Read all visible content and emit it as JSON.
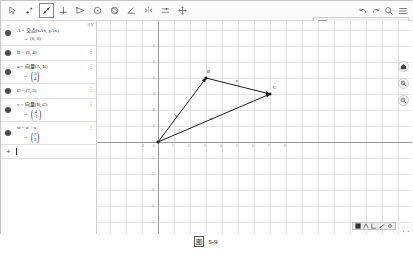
{
  "app": {
    "name": "GeoGebra Classic",
    "caption": "图 5-9"
  },
  "toolbar": {
    "tools": [
      {
        "name": "move-tool",
        "label": "Move",
        "icon": "arrow-cursor-icon",
        "selected": false
      },
      {
        "name": "point-tool",
        "label": "Point",
        "icon": "point-icon",
        "selected": false
      },
      {
        "name": "line-tool",
        "label": "Line",
        "icon": "line-through-two-points-icon",
        "selected": true
      },
      {
        "name": "perpendicular-line-tool",
        "label": "Perpendicular Line",
        "icon": "perpendicular-icon",
        "selected": false
      },
      {
        "name": "polygon-tool",
        "label": "Polygon",
        "icon": "polygon-icon",
        "selected": false
      },
      {
        "name": "circle-tool",
        "label": "Circle with Center through Point",
        "icon": "circle-icon",
        "selected": false
      },
      {
        "name": "ellipse-tool",
        "label": "Ellipse",
        "icon": "ellipse-icon",
        "selected": false
      },
      {
        "name": "angle-tool",
        "label": "Angle",
        "icon": "angle-icon",
        "selected": false
      },
      {
        "name": "reflect-tool",
        "label": "Reflect about Line",
        "icon": "reflect-icon",
        "selected": false
      },
      {
        "name": "slider-tool",
        "label": "Slider",
        "icon": "slider-icon",
        "selected": false
      },
      {
        "name": "move-graphics-tool",
        "label": "Move Graphics View",
        "icon": "move-graphics-icon",
        "selected": false
      }
    ],
    "right_tools": [
      {
        "name": "undo-button",
        "label": "Undo",
        "icon": "undo-icon"
      },
      {
        "name": "redo-button",
        "label": "Redo",
        "icon": "redo-icon"
      },
      {
        "name": "search-button",
        "label": "Search",
        "icon": "search-icon"
      },
      {
        "name": "menu-button",
        "label": "Main Menu",
        "icon": "hamburger-menu-icon"
      }
    ]
  },
  "stylebar": {
    "color_swatch": "#222222",
    "items": [
      {
        "name": "color-button",
        "label": "Color",
        "icon": "color-swatch-icon"
      },
      {
        "name": "line-style-button",
        "label": "Line Style",
        "icon": "line-style-icon"
      },
      {
        "name": "point-style-button",
        "label": "Point Style",
        "icon": "point-style-icon"
      },
      {
        "name": "label-button",
        "label": "Label",
        "icon": "label-icon"
      },
      {
        "name": "settings-button",
        "label": "Settings",
        "icon": "gear-icon"
      },
      {
        "name": "more-button",
        "label": "More",
        "icon": "kebab-menu-icon"
      },
      {
        "name": "close-stylebar-button",
        "label": "Close",
        "icon": "collapse-arrow-icon"
      }
    ]
  },
  "algebra": {
    "header_label": "≡V",
    "rows": [
      {
        "name": "algebra-row-point-a",
        "expression": "A = 交点(xAx, yAx)",
        "output_arrow": "→",
        "output": "(0, 0)",
        "output_kind": "point",
        "visible": true,
        "has_kebab": false
      },
      {
        "name": "algebra-row-point-b",
        "expression": "B = (3, 4)",
        "output_arrow": "",
        "output": "",
        "output_kind": "none",
        "visible": true,
        "has_kebab": true
      },
      {
        "name": "algebra-row-vector-u",
        "expression": "u = 向量(A, B)",
        "output_arrow": "→",
        "output_kind": "column",
        "output_top": "3",
        "output_bottom": "4",
        "visible": true,
        "has_kebab": true
      },
      {
        "name": "algebra-row-point-c",
        "expression": "C = (7, 3)",
        "output_arrow": "",
        "output": "",
        "output_kind": "none",
        "visible": true,
        "has_kebab": true
      },
      {
        "name": "algebra-row-vector-v",
        "expression": "v = 向量(B, C)",
        "output_arrow": "→",
        "output_kind": "column",
        "output_top": "4",
        "output_bottom": "-1",
        "visible": true,
        "has_kebab": true
      },
      {
        "name": "algebra-row-vector-w",
        "expression": "w = u + v",
        "output_arrow": "→",
        "output_kind": "column",
        "output_top": "7",
        "output_bottom": "3",
        "visible": true,
        "has_kebab": true
      }
    ],
    "input_row": {
      "name": "algebra-input-row",
      "plus": "+",
      "value": "",
      "placeholder": ""
    }
  },
  "graph": {
    "xlabel": "x",
    "ylabel": "y",
    "origin_label": "0",
    "x_ticks": [
      "1",
      "2",
      "3",
      "4",
      "5",
      "6",
      "7",
      "8"
    ],
    "x_tick_values": [
      1,
      2,
      3,
      4,
      5,
      6,
      7,
      8
    ],
    "x_neg_ticks": [
      "-1"
    ],
    "y_ticks": [
      "1",
      "2",
      "3",
      "4",
      "5",
      "6"
    ],
    "y_tick_values": [
      1,
      2,
      3,
      4,
      5,
      6
    ],
    "y_neg_ticks": [
      "-1",
      "-2",
      "-3",
      "-4",
      "-5"
    ],
    "points": [
      {
        "name": "point-a",
        "label": "A",
        "x": 0,
        "y": 0,
        "show_label": false
      },
      {
        "name": "point-b",
        "label": "B",
        "x": 3,
        "y": 4,
        "show_label": true
      },
      {
        "name": "point-c",
        "label": "C",
        "x": 7,
        "y": 3,
        "show_label": true
      }
    ],
    "vectors": [
      {
        "name": "vector-u",
        "label": "u",
        "from": [
          0,
          0
        ],
        "to": [
          3,
          4
        ],
        "color": "#1a1a1a"
      },
      {
        "name": "vector-v",
        "label": "v",
        "from": [
          3,
          4
        ],
        "to": [
          7,
          3
        ],
        "color": "#1a1a1a"
      },
      {
        "name": "vector-w",
        "label": "w",
        "from": [
          0,
          0
        ],
        "to": [
          7,
          3
        ],
        "color": "#1a1a1a"
      }
    ],
    "controls": [
      {
        "name": "home-button",
        "label": "Standard View",
        "icon": "home-icon"
      },
      {
        "name": "zoom-in-button",
        "label": "Zoom In",
        "icon": "zoom-in-icon"
      },
      {
        "name": "zoom-out-button",
        "label": "Zoom Out",
        "icon": "zoom-out-icon"
      },
      {
        "name": "drag-corner-handle",
        "label": "Drag",
        "icon": "drag-handle-icon"
      }
    ],
    "minibar_items": [
      {
        "name": "minibar-grid-button",
        "label": "Grid",
        "icon": "grid-icon"
      },
      {
        "name": "minibar-snap-button",
        "label": "Snap",
        "icon": "magnet-icon"
      },
      {
        "name": "minibar-axes-button",
        "label": "Axes",
        "icon": "axes-icon"
      },
      {
        "name": "minibar-ratio-button",
        "label": "Ratio",
        "icon": "ratio-icon"
      },
      {
        "name": "minibar-settings-button",
        "label": "Settings",
        "icon": "gear-icon"
      }
    ]
  }
}
